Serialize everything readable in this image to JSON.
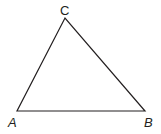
{
  "diagram": {
    "type": "triangle",
    "stroke_color": "#231f20",
    "vertices": [
      {
        "id": "A",
        "label": "A",
        "x": 17,
        "y": 111,
        "label_x": 8,
        "label_y": 127
      },
      {
        "id": "B",
        "label": "B",
        "x": 145,
        "y": 111,
        "label_x": 144,
        "label_y": 127
      },
      {
        "id": "C",
        "label": "C",
        "x": 65,
        "y": 18,
        "label_x": 60,
        "label_y": 15
      }
    ],
    "edges": [
      [
        "A",
        "B"
      ],
      [
        "B",
        "C"
      ],
      [
        "C",
        "A"
      ]
    ]
  }
}
